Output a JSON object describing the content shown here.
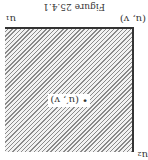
{
  "figure": {
    "caption": "Figure 25.4.1",
    "labels": {
      "top_left": "u₂",
      "bottom_left": "(u, v)",
      "bottom_right": "u₁",
      "point": "• (u′, v)"
    },
    "colors": {
      "hatch": "#8a8a8a",
      "border": "#333333",
      "background": "#ffffff"
    }
  }
}
